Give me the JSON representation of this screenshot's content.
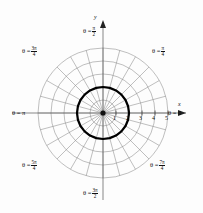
{
  "figure": {
    "background_color": "#fdfdfd",
    "grid_color": "#8a8a8a",
    "axis_color": "#555555",
    "curve_color": "#000000"
  },
  "axes": {
    "x_label": "x",
    "y_label": "y",
    "x_ticks": [
      "1",
      "2",
      "3",
      "4",
      "5"
    ]
  },
  "angle_labels": {
    "theta_0": {
      "theta": "θ =",
      "value": "0",
      "frac": false
    },
    "theta_pi4": {
      "theta": "θ =",
      "num": "π",
      "den": "4",
      "frac": true
    },
    "theta_pi2": {
      "theta": "θ =",
      "num": "π",
      "den": "2",
      "frac": true
    },
    "theta_3pi4": {
      "theta": "θ =",
      "num": "3π",
      "den": "4",
      "frac": true
    },
    "theta_pi": {
      "theta": "θ =",
      "value": "π",
      "frac": false
    },
    "theta_5pi4": {
      "theta": "θ =",
      "num": "5π",
      "den": "4",
      "frac": true
    },
    "theta_3pi2": {
      "theta": "θ =",
      "num": "3π",
      "den": "2",
      "frac": true
    },
    "theta_7pi4": {
      "theta": "θ =",
      "num": "7π",
      "den": "4",
      "frac": true
    }
  },
  "chart_data": {
    "type": "line",
    "coordinate_system": "polar",
    "xlabel": "x",
    "ylabel": "y",
    "grid": true,
    "legend": "none",
    "origin_px": [
      103,
      113
    ],
    "unit_px": 13.0,
    "radial_gridlines": [
      1,
      2,
      3,
      4,
      5
    ],
    "angular_gridlines_count": 24,
    "angular_gridline_step_deg": 15,
    "xlim": [
      -5.5,
      5.5
    ],
    "ylim": [
      -5.5,
      5.5
    ],
    "x_tick_values": [
      1,
      2,
      3,
      4,
      5
    ],
    "theta_tick_labels": [
      "0",
      "π/4",
      "π/2",
      "3π/4",
      "π",
      "5π/4",
      "3π/2",
      "7π/4"
    ],
    "theta_tick_radians": [
      0,
      0.7854,
      1.5708,
      2.3562,
      3.1416,
      3.927,
      4.7124,
      5.4978
    ],
    "series": [
      {
        "name": "r = 2",
        "equation": "r = 2",
        "r_constant": 2,
        "closed": true,
        "linewidth_px": 2.2,
        "color": "#000000",
        "points_polar": [
          {
            "theta_deg": 0,
            "r": 2
          },
          {
            "theta_deg": 15,
            "r": 2
          },
          {
            "theta_deg": 30,
            "r": 2
          },
          {
            "theta_deg": 45,
            "r": 2
          },
          {
            "theta_deg": 60,
            "r": 2
          },
          {
            "theta_deg": 75,
            "r": 2
          },
          {
            "theta_deg": 90,
            "r": 2
          },
          {
            "theta_deg": 105,
            "r": 2
          },
          {
            "theta_deg": 120,
            "r": 2
          },
          {
            "theta_deg": 135,
            "r": 2
          },
          {
            "theta_deg": 150,
            "r": 2
          },
          {
            "theta_deg": 165,
            "r": 2
          },
          {
            "theta_deg": 180,
            "r": 2
          },
          {
            "theta_deg": 195,
            "r": 2
          },
          {
            "theta_deg": 210,
            "r": 2
          },
          {
            "theta_deg": 225,
            "r": 2
          },
          {
            "theta_deg": 240,
            "r": 2
          },
          {
            "theta_deg": 255,
            "r": 2
          },
          {
            "theta_deg": 270,
            "r": 2
          },
          {
            "theta_deg": 285,
            "r": 2
          },
          {
            "theta_deg": 300,
            "r": 2
          },
          {
            "theta_deg": 315,
            "r": 2
          },
          {
            "theta_deg": 330,
            "r": 2
          },
          {
            "theta_deg": 345,
            "r": 2
          }
        ]
      }
    ]
  }
}
